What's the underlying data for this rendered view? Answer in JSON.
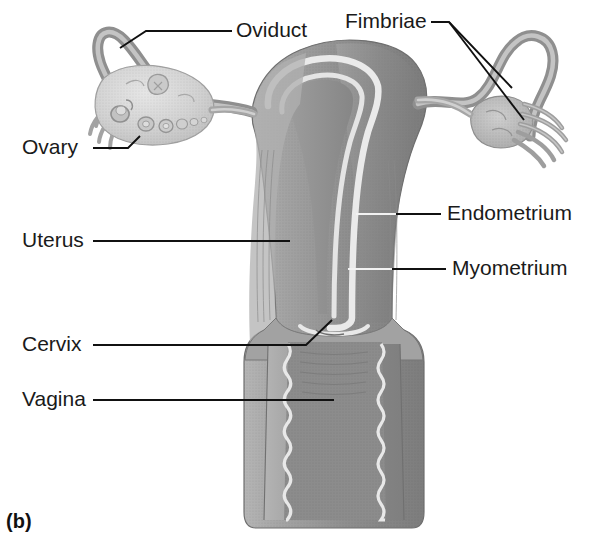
{
  "figure": {
    "panel_label": "(b)",
    "background_color": "#ffffff",
    "ink_color": "#1a1a1a"
  },
  "labels": [
    {
      "id": "oviduct",
      "text": "Oviduct",
      "x": 236,
      "y": 31,
      "anchor": "start"
    },
    {
      "id": "fimbriae",
      "text": "Fimbriae",
      "x": 345,
      "y": 22,
      "anchor": "start"
    },
    {
      "id": "ovary",
      "text": "Ovary",
      "x": 22,
      "y": 148,
      "anchor": "start"
    },
    {
      "id": "uterus",
      "text": "Uterus",
      "x": 22,
      "y": 241,
      "anchor": "start"
    },
    {
      "id": "cervix",
      "text": "Cervix",
      "x": 22,
      "y": 345,
      "anchor": "start"
    },
    {
      "id": "vagina",
      "text": "Vagina",
      "x": 22,
      "y": 400,
      "anchor": "start"
    },
    {
      "id": "endometrium",
      "text": "Endometrium",
      "x": 447,
      "y": 214,
      "anchor": "start"
    },
    {
      "id": "myometrium",
      "text": "Myometrium",
      "x": 452,
      "y": 269,
      "anchor": "start"
    }
  ],
  "structures": [
    {
      "id": "left-oviduct",
      "name": "Oviduct (left fallopian tube)"
    },
    {
      "id": "right-oviduct",
      "name": "Oviduct (right fallopian tube)"
    },
    {
      "id": "left-ovary",
      "name": "Ovary (left, sectioned showing follicles)"
    },
    {
      "id": "right-ovary",
      "name": "Ovary (right)"
    },
    {
      "id": "left-fimbriae",
      "name": "Fimbriae (left)"
    },
    {
      "id": "right-fimbriae",
      "name": "Fimbriae (right)"
    },
    {
      "id": "uterus-body",
      "name": "Uterus"
    },
    {
      "id": "endometrium",
      "name": "Endometrium (uterine lining)"
    },
    {
      "id": "myometrium",
      "name": "Myometrium (uterine muscle wall)"
    },
    {
      "id": "uterine-cavity",
      "name": "Uterine cavity"
    },
    {
      "id": "cervix",
      "name": "Cervix"
    },
    {
      "id": "vagina",
      "name": "Vagina with rugae"
    }
  ],
  "colors": {
    "tissue_mid": "#9a9a9a",
    "tissue_dark": "#7e7e7e",
    "tissue_light": "#b9b9b9",
    "tissue_pale": "#cfcfcf",
    "ovary_fill": "#d8d8d8",
    "highlight": "#eeeeee",
    "outline": "#6d6d6d",
    "leader": "#111111"
  }
}
